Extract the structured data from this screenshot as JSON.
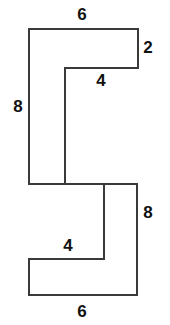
{
  "figure": {
    "background_color": "#ffffff",
    "stroke_color": "#3a3a3a",
    "stroke_width": 2,
    "label_color": "#111111"
  },
  "shape": {
    "name": "s-polygon",
    "outline_points": "29,29 138,29 138,68 65,68 65,184 137,184 137,295 29,295 29,259 104,259 104,184 29,184",
    "vertices": [
      {
        "x": 29,
        "y": 29
      },
      {
        "x": 138,
        "y": 29
      },
      {
        "x": 138,
        "y": 68
      },
      {
        "x": 65,
        "y": 68
      },
      {
        "x": 65,
        "y": 184
      },
      {
        "x": 137,
        "y": 184
      },
      {
        "x": 137,
        "y": 295
      },
      {
        "x": 29,
        "y": 295
      },
      {
        "x": 29,
        "y": 259
      },
      {
        "x": 104,
        "y": 259
      },
      {
        "x": 104,
        "y": 184
      },
      {
        "x": 29,
        "y": 184
      }
    ]
  },
  "labels": [
    {
      "name": "top-width-label",
      "text": "6",
      "x": 82,
      "y": 14,
      "side": "top-outer-horizontal"
    },
    {
      "name": "top-right-height-label",
      "text": "2",
      "x": 148,
      "y": 47,
      "side": "right-upper-vertical"
    },
    {
      "name": "upper-notch-label",
      "text": "4",
      "x": 101,
      "y": 80,
      "side": "inner-upper-horizontal"
    },
    {
      "name": "left-height-label",
      "text": "8",
      "x": 18,
      "y": 106,
      "side": "left-outer-vertical"
    },
    {
      "name": "right-height-label",
      "text": "8",
      "x": 148,
      "y": 212,
      "side": "right-lower-vertical"
    },
    {
      "name": "lower-notch-label",
      "text": "4",
      "x": 68,
      "y": 245,
      "side": "inner-lower-horizontal"
    },
    {
      "name": "bottom-width-label",
      "text": "6",
      "x": 82,
      "y": 311,
      "side": "bottom-outer-horizontal"
    }
  ]
}
